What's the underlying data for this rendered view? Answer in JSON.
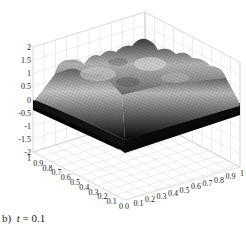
{
  "caption": {
    "label": "b)",
    "variable": "t",
    "equals": "=",
    "value": "0.1"
  },
  "chart_data": {
    "type": "surface3d",
    "title": "",
    "caption": "b)  t = 0.1",
    "xlabel": "",
    "ylabel": "",
    "zlabel": "",
    "x_ticks": [
      "0",
      "0.1",
      "0.2",
      "0.3",
      "0.4",
      "0.5",
      "0.6",
      "0.7",
      "0.8",
      "0.9",
      "1"
    ],
    "y_ticks": [
      "1",
      "0.9",
      "0.8",
      "0.7",
      "0.6",
      "0.5",
      "0.4",
      "0.3",
      "0.2",
      "0.1",
      "0"
    ],
    "z_ticks": [
      "2",
      "1.5",
      "1",
      "0.5",
      "0",
      "-0.5",
      "-1",
      "-1.5",
      "-2"
    ],
    "xlim": [
      0,
      1
    ],
    "ylim": [
      0,
      1
    ],
    "zlim": [
      -2,
      2
    ],
    "grid": true,
    "colormap": "grayscale",
    "surface_description": "Plateau-shaped surface around z≈1 in the interior with several bumps (local maxima up to ~1.7) and dips, dropping steeply toward z≈0 along the domain boundary; lower rim rendered dark/black near z≈0 to -0.3.",
    "approx_peak_z": 1.7,
    "approx_boundary_z": 0
  }
}
